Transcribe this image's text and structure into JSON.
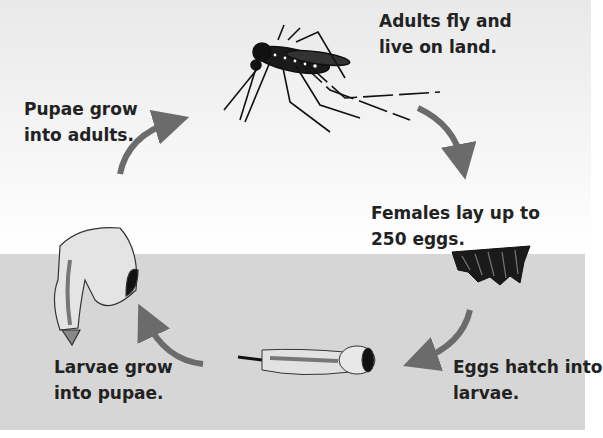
{
  "stages": {
    "adult": "Adults fly and\nlive on land.",
    "eggs": "Females lay up to\n250 eggs.",
    "larvae": "Eggs hatch into\nlarvae.",
    "pupae_label": "Larvae grow\ninto pupae.",
    "pupae_to_adult": "Pupae grow\ninto adults."
  },
  "colors": {
    "arrow": "#6b6b6b",
    "water": "#d6d6d6",
    "text": "#222222"
  }
}
